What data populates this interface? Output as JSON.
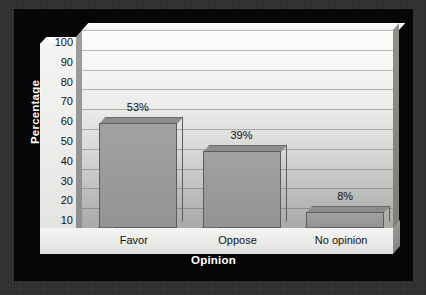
{
  "chart_data": {
    "type": "bar",
    "title": "",
    "xlabel": "Opinion",
    "ylabel": "Percentage",
    "categories": [
      "Favor",
      "Oppose",
      "No opinion"
    ],
    "values": [
      53,
      39,
      8
    ],
    "value_labels": [
      "53%",
      "39%",
      "8%"
    ],
    "ylim": [
      0,
      100
    ],
    "ytick_step": 10,
    "yticks": [
      100,
      90,
      80,
      70,
      60,
      50,
      40,
      30,
      20,
      10,
      0
    ],
    "ytick_labels": [
      "100",
      "90",
      "80",
      "70",
      "60",
      "50",
      "40",
      "30",
      "20",
      "10",
      "0"
    ],
    "grid": true,
    "grid_axis": "y",
    "legend": false,
    "legend_position": "none",
    "style": "3d-perspective",
    "series": [
      {
        "name": "Percentage",
        "values": [
          53,
          39,
          8
        ]
      }
    ]
  },
  "colors": {
    "outer_background": "#2f2f2f",
    "panel_background": "#060606",
    "axis_panel": "#f0f0ee",
    "wall_top": "#fcfcfb",
    "wall_bottom": "#a6a6a4",
    "bar_fill": "#9a9a98",
    "bar_outline": "#5d5d5b",
    "gridline": "#5a5a58",
    "label_text": "#111111",
    "axis_title_text": "#ffffff"
  }
}
